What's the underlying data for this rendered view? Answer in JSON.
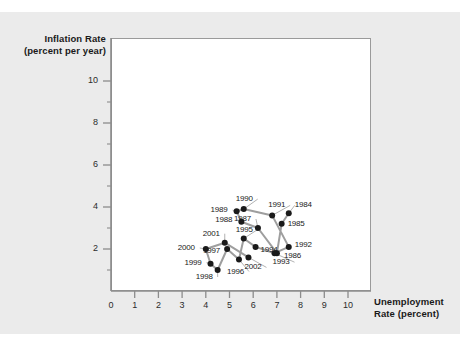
{
  "figure": {
    "background_color": "#ebebeb",
    "plot_background_color": "#ffffff",
    "axis_color": "#8c8c8c",
    "point_color": "#1a1a1a",
    "line_color": "#9e9e9e"
  },
  "axes": {
    "y_title_line1": "Inflation Rate",
    "y_title_line2": "(percent per year)",
    "x_title_line1": "Unemployment",
    "x_title_line2": "Rate (percent)",
    "x_ticks": [
      "0",
      "1",
      "2",
      "3",
      "4",
      "5",
      "6",
      "7",
      "8",
      "9",
      "10"
    ],
    "y_ticks": [
      "0",
      "2",
      "4",
      "6",
      "8",
      "10"
    ],
    "origin_label": "0"
  },
  "chart_data": {
    "type": "scatter",
    "title": "",
    "xlabel": "Unemployment Rate (percent)",
    "ylabel": "Inflation Rate (percent per year)",
    "xlim": [
      0,
      10
    ],
    "ylim": [
      0,
      11
    ],
    "x_tick_values": [
      0,
      1,
      2,
      3,
      4,
      5,
      6,
      7,
      8,
      9,
      10
    ],
    "y_tick_values": [
      0,
      2,
      4,
      6,
      8,
      10
    ],
    "grid": false,
    "legend": null,
    "connected": true,
    "series_name": "Phillips curve 1984-2002",
    "point_label_key": "year",
    "points": [
      {
        "year": "1984",
        "x": 7.5,
        "y": 3.7,
        "label_dx": 6,
        "label_dy": -8
      },
      {
        "year": "1985",
        "x": 7.2,
        "y": 3.2,
        "label_dx": 6,
        "label_dy": 0
      },
      {
        "year": "1986",
        "x": 7.0,
        "y": 1.8,
        "label_dx": 7,
        "label_dy": 3
      },
      {
        "year": "1987",
        "x": 6.2,
        "y": 3.0,
        "label_dx": -24,
        "label_dy": -9
      },
      {
        "year": "1988",
        "x": 5.5,
        "y": 3.3,
        "label_dx": -26,
        "label_dy": -2
      },
      {
        "year": "1989",
        "x": 5.3,
        "y": 3.8,
        "label_dx": -26,
        "label_dy": -1
      },
      {
        "year": "1990",
        "x": 5.6,
        "y": 3.9,
        "label_dx": -8,
        "label_dy": -10
      },
      {
        "year": "1991",
        "x": 6.8,
        "y": 3.6,
        "label_dx": -4,
        "label_dy": -10
      },
      {
        "year": "1992",
        "x": 7.5,
        "y": 2.1,
        "label_dx": 6,
        "label_dy": -2
      },
      {
        "year": "1993",
        "x": 6.9,
        "y": 1.8,
        "label_dx": -2,
        "label_dy": 9
      },
      {
        "year": "1994",
        "x": 6.1,
        "y": 2.1,
        "label_dx": 5,
        "label_dy": 3
      },
      {
        "year": "1995",
        "x": 5.6,
        "y": 2.5,
        "label_dx": -8,
        "label_dy": -9
      },
      {
        "year": "1996",
        "x": 5.4,
        "y": 1.5,
        "label_dx": -12,
        "label_dy": 12
      },
      {
        "year": "1997",
        "x": 4.9,
        "y": 2.0,
        "label_dx": -24,
        "label_dy": 2
      },
      {
        "year": "1998",
        "x": 4.5,
        "y": 1.0,
        "label_dx": -22,
        "label_dy": 7
      },
      {
        "year": "1999",
        "x": 4.2,
        "y": 1.3,
        "label_dx": -26,
        "label_dy": -1
      },
      {
        "year": "2000",
        "x": 4.0,
        "y": 2.0,
        "label_dx": -28,
        "label_dy": -1
      },
      {
        "year": "2001",
        "x": 4.8,
        "y": 2.3,
        "label_dx": -22,
        "label_dy": -9
      },
      {
        "year": "2002",
        "x": 5.8,
        "y": 1.6,
        "label_dx": -4,
        "label_dy": 10
      }
    ],
    "path_order": [
      "1984",
      "1985",
      "1986",
      "1987",
      "1988",
      "1989",
      "1990",
      "1991",
      "1992",
      "1993",
      "1994",
      "1995",
      "1996",
      "1997",
      "1998",
      "1999",
      "2000",
      "2001",
      "2002"
    ]
  }
}
